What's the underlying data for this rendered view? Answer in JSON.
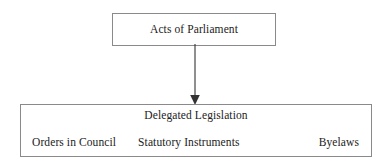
{
  "diagram": {
    "type": "flowchart",
    "colors": {
      "background": "#ffffff",
      "border": "#8a8a8a",
      "text": "#222222",
      "arrow": "#333333"
    },
    "nodes": {
      "top": {
        "label": "Acts of Parliament"
      },
      "bottom": {
        "title": "Delegated Legislation",
        "children": [
          {
            "label": "Orders in Council"
          },
          {
            "label": "Statutory Instruments"
          },
          {
            "label": "Byelaws"
          }
        ]
      }
    },
    "connector": {
      "from": "Acts of Parliament",
      "to": "Delegated Legislation",
      "direction": "down",
      "arrowhead": "filled-triangle"
    }
  }
}
